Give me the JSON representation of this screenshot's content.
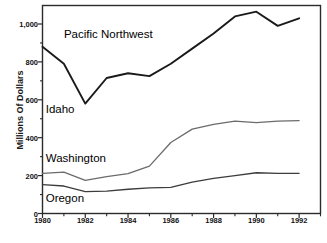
{
  "chart_data": {
    "type": "line",
    "title": "",
    "xlabel": "",
    "ylabel": "Millions Of Dollars",
    "xlim": [
      1980,
      1993
    ],
    "ylim": [
      0,
      1100
    ],
    "grid": false,
    "legend": "inline-labels",
    "x": [
      1980,
      1981,
      1982,
      1983,
      1984,
      1985,
      1986,
      1987,
      1988,
      1989,
      1990,
      1991,
      1992
    ],
    "y_major_ticks": [
      0,
      200,
      400,
      600,
      800,
      1000
    ],
    "y_major_tick_labels": [
      "0",
      "200",
      "400",
      "600",
      "800",
      "1,000"
    ],
    "y_minor_ticks": [
      100,
      300,
      500,
      700,
      900
    ],
    "x_major_ticks": [
      1980,
      1982,
      1984,
      1986,
      1988,
      1990,
      1992
    ],
    "x_major_tick_labels": [
      "1980",
      "1982",
      "1984",
      "1986",
      "1988",
      "1990",
      "1992"
    ],
    "x_minor_ticks": [
      1981,
      1983,
      1985,
      1987,
      1989,
      1991,
      1993
    ],
    "series": [
      {
        "name": "Pacific Northwest",
        "color": "#1a1a1a",
        "width": 1.9,
        "label_x": 1981.0,
        "label_y": 940,
        "values": [
          880,
          790,
          580,
          715,
          740,
          725,
          790,
          870,
          950,
          1040,
          1065,
          990,
          1030
        ]
      },
      {
        "name": "Washington",
        "color": "#6b6b6b",
        "width": 1.3,
        "label_x": 1980.15,
        "label_y": 285,
        "values": [
          212,
          218,
          175,
          195,
          210,
          250,
          375,
          445,
          470,
          487,
          480,
          487,
          490
        ]
      },
      {
        "name": "Oregon",
        "color": "#3c3c3c",
        "width": 1.3,
        "label_x": 1980.15,
        "label_y": 75,
        "values": [
          152,
          145,
          115,
          118,
          128,
          135,
          138,
          165,
          185,
          200,
          215,
          212,
          212
        ]
      }
    ],
    "annotations": [
      {
        "text": "Idaho",
        "x": 1980.15,
        "y": 545
      }
    ]
  }
}
